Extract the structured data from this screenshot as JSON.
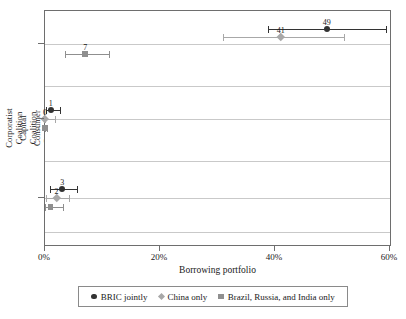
{
  "chart_data": {
    "type": "scatter",
    "title": "",
    "xlabel": "Borrowing portfolio",
    "ylabel": "",
    "xlim": [
      0,
      60
    ],
    "xtick_labels": [
      "0%",
      "20%",
      "40%",
      "60%"
    ],
    "xticks": [
      0,
      20,
      40,
      60
    ],
    "categories": [
      "Corporatist Coalition",
      "Capital Coalition",
      "Consumer Coalition"
    ],
    "grid": true,
    "legend_position": "bottom",
    "series": [
      {
        "name": "BRIC jointly",
        "marker": "circle",
        "color": "#333333",
        "points": [
          {
            "category": "Corporatist Coalition",
            "value": 49,
            "label": "49",
            "ci_low": 38.7,
            "ci_high": 59.3
          },
          {
            "category": "Capital Coalition",
            "value": 1,
            "label": "1",
            "ci_low": 0.2,
            "ci_high": 2.6
          },
          {
            "category": "Consumer Coalition",
            "value": 3,
            "label": "3",
            "ci_low": 0.8,
            "ci_high": 5.6
          }
        ]
      },
      {
        "name": "China only",
        "marker": "diamond",
        "color": "#a8a8a8",
        "points": [
          {
            "category": "Corporatist Coalition",
            "value": 41,
            "label": "41",
            "ci_low": 31.0,
            "ci_high": 52.0
          },
          {
            "category": "Capital Coalition",
            "value": 0,
            "label": "0",
            "ci_low": 0.0,
            "ci_high": 1.8
          },
          {
            "category": "Consumer Coalition",
            "value": 2,
            "label": "2",
            "ci_low": 0.2,
            "ci_high": 4.2
          }
        ]
      },
      {
        "name": "Brazil, Russia, and India only",
        "marker": "square",
        "color": "#8f8f8f",
        "points": [
          {
            "category": "Corporatist Coalition",
            "value": 7,
            "label": "7",
            "ci_low": 3.5,
            "ci_high": 11.2
          },
          {
            "category": "Capital Coalition",
            "value": 0,
            "label": "",
            "ci_low": 0.0,
            "ci_high": 0.4
          },
          {
            "category": "Consumer Coalition",
            "value": 1,
            "label": "",
            "ci_low": 0.0,
            "ci_high": 3.2
          }
        ]
      }
    ]
  },
  "axes": {
    "x_title": "Borrowing portfolio",
    "x_tick_labels": [
      "0%",
      "20%",
      "40%",
      "60%"
    ],
    "y_category_labels": [
      {
        "line1": "Corporatist",
        "line2": "Coalition"
      },
      {
        "line1": "Capital",
        "line2": "Coalition"
      },
      {
        "line1": "Consumer",
        "line2": "Coalition"
      }
    ]
  },
  "legend": {
    "items": [
      {
        "label": "BRIC jointly",
        "marker": "circle-marker-icon"
      },
      {
        "label": "China only",
        "marker": "diamond-marker-icon"
      },
      {
        "label": "Brazil, Russia, and India only",
        "marker": "square-marker-icon"
      }
    ]
  }
}
